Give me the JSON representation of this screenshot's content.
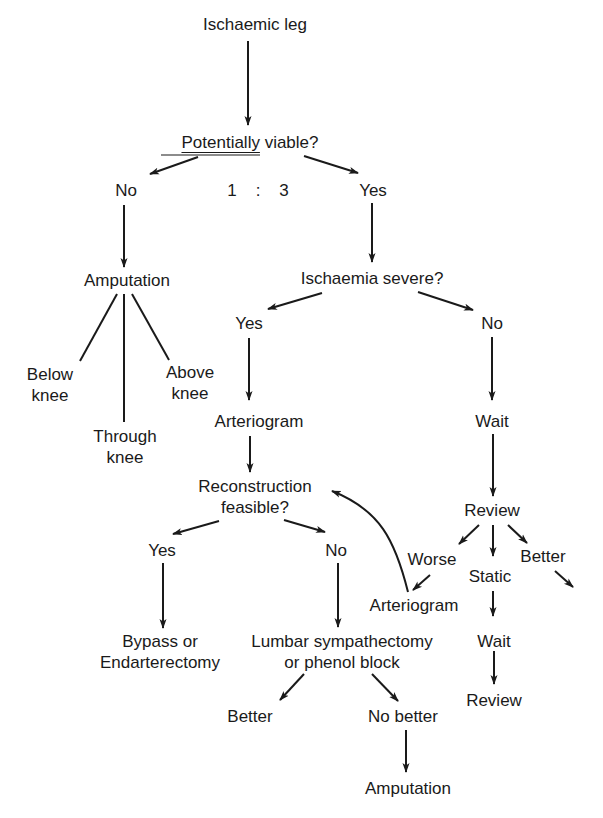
{
  "diagram": {
    "title": "Ischaemic leg",
    "nodes": {
      "root": "Ischaemic leg",
      "viable_q_underlined": "Potentially",
      "viable_q_rest": " viable?",
      "viable_no": "No",
      "ratio": "1    :    3",
      "viable_yes": "Yes",
      "amputation": "Amputation",
      "below_knee_1": "Below",
      "below_knee_2": "knee",
      "through_knee_1": "Through",
      "through_knee_2": "knee",
      "above_knee_1": "Above",
      "above_knee_2": "knee",
      "severe_q": "Ischaemia severe?",
      "severe_yes": "Yes",
      "severe_no": "No",
      "arteriogram_1": "Arteriogram",
      "wait_1": "Wait",
      "recon_q_1": "Reconstruction",
      "recon_q_2": "feasible?",
      "review_1": "Review",
      "recon_yes": "Yes",
      "recon_no": "No",
      "worse": "Worse",
      "static": "Static",
      "better_right": "Better",
      "arteriogram_2": "Arteriogram",
      "bypass_1": "Bypass or",
      "bypass_2": "Endarterectomy",
      "lumbar_1": "Lumbar sympathectomy",
      "lumbar_2": "or phenol block",
      "wait_2": "Wait",
      "review_2": "Review",
      "better_left": "Better",
      "no_better": "No better",
      "amputation_2": "Amputation"
    },
    "line_color": "#1a1a1a"
  }
}
